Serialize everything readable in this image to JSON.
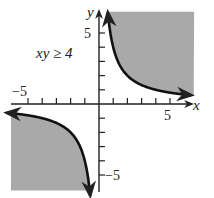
{
  "chart_data": {
    "type": "area",
    "title": "",
    "annotation": "xy ≥ 4",
    "xlabel": "x",
    "ylabel": "y",
    "xlim": [
      -6.2,
      6.7
    ],
    "ylim": [
      -6.1,
      6.5
    ],
    "x_tick_labels": [
      "-5",
      "5"
    ],
    "y_tick_labels": [
      "5",
      "-5"
    ],
    "tick_step": 1,
    "grid": false,
    "shade_color": "#a9a9a9",
    "curve_color": "#111111",
    "series": [
      {
        "name": "xy = 4 (first quadrant branch)",
        "x": [
          0.62,
          0.8,
          1,
          1.5,
          2,
          3,
          4,
          5,
          6.5
        ],
        "y": [
          6.45,
          5,
          4,
          2.67,
          2,
          1.33,
          1,
          0.8,
          0.62
        ]
      },
      {
        "name": "xy = 4 (third quadrant branch)",
        "x": [
          -6.5,
          -5,
          -4,
          -3,
          -2,
          -1.5,
          -1,
          -0.8,
          -0.62
        ],
        "y": [
          -0.62,
          -0.8,
          -1,
          -1.33,
          -2,
          -2.67,
          -4,
          -5,
          -6.45
        ]
      }
    ],
    "shaded_regions": [
      {
        "description": "region above/right of first-quadrant branch",
        "x_range": [
          0.62,
          6.7
        ],
        "y_range": [
          0.62,
          6.5
        ]
      },
      {
        "description": "region below/left of third-quadrant branch",
        "x_range": [
          -6.2,
          -0.62
        ],
        "y_range": [
          -6.1,
          -0.62
        ]
      }
    ]
  },
  "labels": {
    "annotation": "xy ≥ 4",
    "x_axis": "x",
    "y_axis": "y",
    "x_neg5": "−5",
    "x_pos5": "5",
    "y_pos5": "5",
    "y_neg5": "−5"
  }
}
